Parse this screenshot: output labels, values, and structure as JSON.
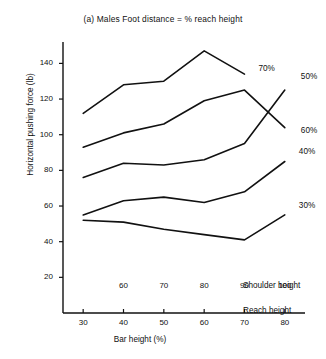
{
  "figure": {
    "title": "(a) Males Foot distance  =  % reach height",
    "caption_row_shoulder": "Shoulder height",
    "caption_row_reach": "Reach height"
  },
  "chart_data": {
    "type": "line",
    "title": "(a) Males Foot distance  =  % reach height",
    "xlabel": "Bar height (%)",
    "ylabel": "Horizontal pushing force (lb)",
    "xlim": [
      25,
      85
    ],
    "ylim": [
      0,
      152
    ],
    "grid": false,
    "legend": "inline-right-of-line-ends",
    "x_axes": [
      {
        "name": "Reach height",
        "ticks": [
          30,
          40,
          50,
          60,
          70,
          80
        ],
        "tick_labels": [
          "30",
          "40",
          "50",
          "60",
          "70",
          "80"
        ]
      },
      {
        "name": "Shoulder height",
        "ticks": [
          40,
          50,
          60,
          70,
          80
        ],
        "tick_labels": [
          "60",
          "70",
          "80",
          "90",
          "100"
        ]
      }
    ],
    "y_ticks": [
      20,
      40,
      60,
      80,
      100,
      120,
      140
    ],
    "y_tick_labels": [
      "20",
      "40",
      "60",
      "80",
      "100",
      "120",
      "140"
    ],
    "x": [
      30,
      40,
      50,
      60,
      70,
      80
    ],
    "series": [
      {
        "name": "70%",
        "label": "70%",
        "x": [
          30,
          40,
          50,
          60,
          70
        ],
        "values": [
          112,
          128,
          130,
          147,
          134
        ]
      },
      {
        "name": "60%",
        "label": "60%",
        "x": [
          30,
          40,
          50,
          60,
          70,
          80
        ],
        "values": [
          93,
          101,
          106,
          119,
          125,
          104
        ]
      },
      {
        "name": "50%",
        "label": "50%",
        "x": [
          30,
          40,
          50,
          60,
          70,
          80
        ],
        "values": [
          76,
          84,
          83,
          86,
          95,
          125
        ]
      },
      {
        "name": "40%",
        "label": "40%",
        "x": [
          30,
          40,
          50,
          60,
          70,
          80
        ],
        "values": [
          55,
          63,
          65,
          62,
          68,
          85
        ]
      },
      {
        "name": "30%",
        "label": "30%",
        "x": [
          30,
          40,
          50,
          60,
          70,
          80
        ],
        "values": [
          52,
          51,
          47,
          44,
          41,
          55
        ]
      }
    ]
  }
}
